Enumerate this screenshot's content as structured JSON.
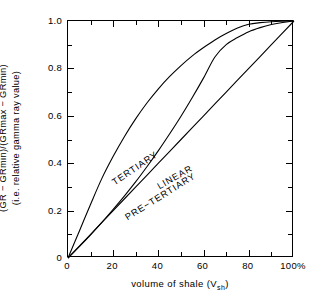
{
  "chart_data": {
    "type": "line",
    "title": "",
    "xlabel": "volume of shale (Vsh)",
    "xlabel_main": "volume of shale (V",
    "xlabel_sub": "sh",
    "xlabel_close": ")",
    "ylabel_line1": "(GR − GRmin)/(GRmax − GRmin)",
    "ylabel_line2": "(i.e. relative gamma ray value)",
    "xlim": [
      0,
      100
    ],
    "ylim": [
      0,
      1.0
    ],
    "grid": false,
    "legend": "inline-curve-labels",
    "xticks": [
      0,
      20,
      40,
      60,
      80,
      100
    ],
    "xticklabels": [
      "0",
      "20",
      "40",
      "60",
      "80",
      "100%"
    ],
    "xminorticks": [
      10,
      30,
      50,
      70,
      90
    ],
    "yticks": [
      0,
      0.2,
      0.4,
      0.6,
      0.8,
      1.0
    ],
    "yticklabels": [
      "0",
      "0.2",
      "0.4",
      "0.6",
      "0.8",
      "1.0"
    ],
    "yminorticks": [
      0.1,
      0.3,
      0.5,
      0.7,
      0.9
    ],
    "line_color": "#000000",
    "series": [
      {
        "name": "TERTIARY",
        "label": "TERTIARY",
        "x": [
          0,
          5,
          10,
          15,
          20,
          25,
          30,
          35,
          40,
          45,
          50,
          55,
          60,
          65,
          70,
          75,
          80,
          85,
          90,
          95,
          100
        ],
        "values": [
          0.0,
          0.113,
          0.227,
          0.336,
          0.429,
          0.513,
          0.588,
          0.655,
          0.714,
          0.766,
          0.812,
          0.853,
          0.888,
          0.92,
          0.947,
          0.97,
          0.986,
          0.993,
          0.997,
          0.999,
          1.0
        ]
      },
      {
        "name": "PRE-TERTIARY",
        "label": "PRE−TERTIARY",
        "x": [
          0,
          5,
          10,
          15,
          20,
          25,
          30,
          35,
          40,
          45,
          50,
          55,
          60,
          65,
          70,
          75,
          80,
          85,
          90,
          95,
          100
        ],
        "values": [
          0.0,
          0.048,
          0.098,
          0.15,
          0.205,
          0.262,
          0.322,
          0.386,
          0.453,
          0.524,
          0.598,
          0.677,
          0.76,
          0.848,
          0.9,
          0.93,
          0.955,
          0.972,
          0.985,
          0.994,
          1.0
        ]
      },
      {
        "name": "LINEAR",
        "label": "LINEAR",
        "x": [
          0,
          10,
          20,
          30,
          40,
          50,
          60,
          70,
          80,
          90,
          100
        ],
        "values": [
          0.0,
          0.1,
          0.2,
          0.3,
          0.4,
          0.5,
          0.6,
          0.7,
          0.8,
          0.9,
          1.0
        ]
      }
    ]
  }
}
